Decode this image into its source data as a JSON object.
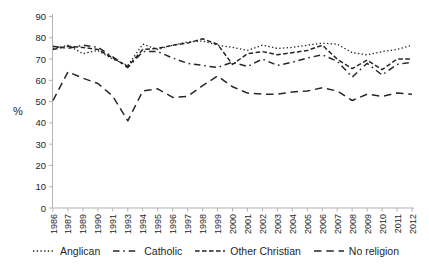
{
  "ylabel": "%",
  "chart_data": {
    "type": "line",
    "title": "",
    "xlabel": "",
    "ylabel": "%",
    "ylim": [
      0,
      90
    ],
    "ytick_step": 10,
    "grid": false,
    "legend_position": "bottom",
    "line_color": "#262626",
    "axis_color": "#b3b3b3",
    "tick_text_color": "#262626",
    "categories": [
      "1986",
      "1987",
      "1989",
      "1990",
      "1991",
      "1993",
      "1994",
      "1995",
      "1996",
      "1997",
      "1998",
      "1999",
      "2000",
      "2001",
      "2002",
      "2003",
      "2004",
      "2005",
      "2006",
      "2007",
      "2008",
      "2009",
      "2010",
      "2011",
      "2012"
    ],
    "series": [
      {
        "name": "Anglican",
        "dash": "dotted",
        "values": [
          75,
          76.5,
          72.5,
          74,
          70,
          67,
          77,
          74.5,
          76.5,
          78,
          78.5,
          76.5,
          75.5,
          74,
          76.5,
          75,
          75.5,
          76.5,
          77.5,
          77,
          73,
          72,
          73.5,
          74.5,
          76.5
        ]
      },
      {
        "name": "Catholic",
        "dash": "dash-dot",
        "values": [
          76,
          75,
          76.5,
          75.5,
          71,
          66,
          73.5,
          73.5,
          70.5,
          68,
          67,
          66,
          68.5,
          66.5,
          70,
          67,
          68.5,
          70.5,
          72,
          69,
          61.5,
          68,
          62.5,
          67.5,
          68.5
        ]
      },
      {
        "name": "Other Christian",
        "dash": "dashed",
        "values": [
          74.5,
          76,
          75.5,
          74.5,
          70.5,
          66.5,
          74.5,
          75,
          76.5,
          77.5,
          79.5,
          77,
          67.5,
          72.5,
          73.5,
          72,
          73,
          74,
          76.5,
          70,
          65.5,
          69.5,
          65,
          70,
          70
        ]
      },
      {
        "name": "No religion",
        "dash": "long-dash",
        "values": [
          50.5,
          64,
          61,
          58.5,
          52.5,
          41,
          55,
          56,
          52,
          52.5,
          57.5,
          62,
          57,
          54,
          53.5,
          53.5,
          54.5,
          55,
          56.5,
          55,
          50.5,
          53.5,
          52.5,
          54,
          53.5
        ]
      }
    ]
  },
  "legend": {
    "items": [
      "Anglican",
      "Catholic",
      "Other Christian",
      "No religion"
    ]
  }
}
